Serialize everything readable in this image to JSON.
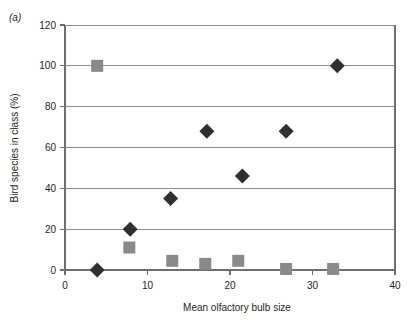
{
  "figure": {
    "panel_label": "(a)"
  },
  "chart_data": {
    "type": "scatter",
    "title": "",
    "xlabel": "Mean olfactory bulb size",
    "ylabel": "Bird species in class (%)",
    "xlim": [
      0,
      40
    ],
    "ylim": [
      0,
      120
    ],
    "xticks": [
      0,
      10,
      20,
      30,
      40
    ],
    "yticks": [
      0,
      20,
      40,
      60,
      80,
      100,
      120
    ],
    "xtick_labels": [
      "0",
      "10",
      "20",
      "30",
      "40"
    ],
    "ytick_labels": [
      "0",
      "20",
      "40",
      "60",
      "80",
      "100",
      "120"
    ],
    "grid": "horizontal",
    "legend": "none",
    "series": [
      {
        "name": "diamond-series",
        "marker": "diamond",
        "color": "#2f2f2f",
        "points": [
          {
            "x": 3.9,
            "y": 0
          },
          {
            "x": 7.9,
            "y": 20
          },
          {
            "x": 12.8,
            "y": 35
          },
          {
            "x": 17.2,
            "y": 68
          },
          {
            "x": 21.5,
            "y": 46
          },
          {
            "x": 26.8,
            "y": 68
          },
          {
            "x": 33.0,
            "y": 100
          }
        ]
      },
      {
        "name": "square-series",
        "marker": "square",
        "color": "#8a8a8a",
        "points": [
          {
            "x": 3.9,
            "y": 100
          },
          {
            "x": 7.8,
            "y": 11
          },
          {
            "x": 13.0,
            "y": 4.5
          },
          {
            "x": 17.0,
            "y": 3
          },
          {
            "x": 21.0,
            "y": 4.5
          },
          {
            "x": 26.8,
            "y": 0.5
          },
          {
            "x": 32.5,
            "y": 0.5
          }
        ]
      }
    ]
  }
}
